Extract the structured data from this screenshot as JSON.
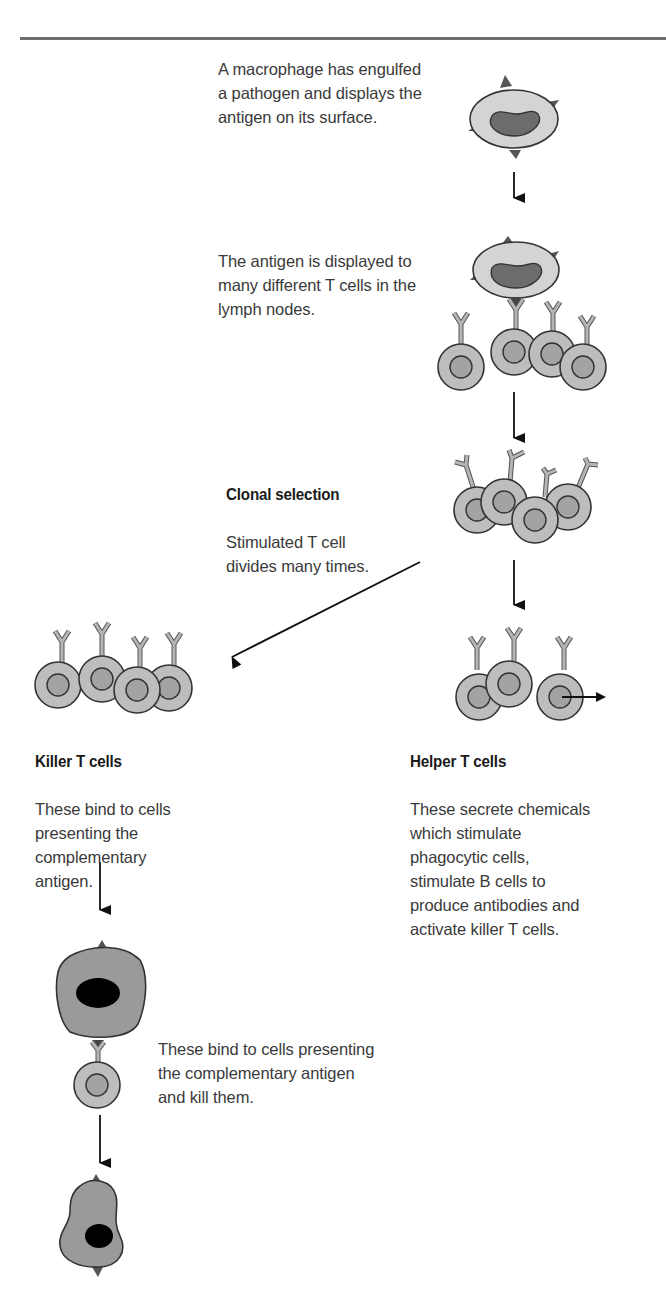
{
  "diagram": {
    "title": "",
    "colors": {
      "cell_fill": "#b9b9b9",
      "cell_nucleus": "#a0a0a0",
      "macrophage_fill": "#d2d2d2",
      "macrophage_nucleus": "#6e6e6e",
      "antigen": "#555555",
      "target_cell_fill": "#9a9a9a",
      "target_nucleus": "#000000",
      "outline": "#333333",
      "arrow": "#111111"
    },
    "steps": [
      {
        "id": "macrophage",
        "text": "A macrophage has engulfed\na pathogen and displays the\nantigen on its surface."
      },
      {
        "id": "presentation",
        "text": "The antigen is displayed to\nmany different T cells in the\nlymph nodes."
      },
      {
        "id": "clonal_selection",
        "title": "Clonal selection",
        "text": "Stimulated T cell\ndivides many times."
      },
      {
        "id": "killer",
        "title": "Killer T cells",
        "text": "These bind to cells\npresenting the\ncomplementary\nantigen."
      },
      {
        "id": "helper",
        "title": "Helper T cells",
        "text": "These secrete chemicals\nwhich stimulate\nphagocytic cells,\nstimulate B cells to\nproduce antibodies and\nactivate killer T cells."
      },
      {
        "id": "kill",
        "text": "These bind to cells presenting\nthe complementary antigen\nand kill them."
      }
    ],
    "arrows": [
      {
        "from": "macrophage",
        "to": "presentation"
      },
      {
        "from": "presentation",
        "to": "clonal_selection"
      },
      {
        "from": "clonal_selection",
        "to": "helper"
      },
      {
        "from": "clonal_selection",
        "to": "killer"
      },
      {
        "from": "killer",
        "to": "kill"
      },
      {
        "from": "kill",
        "to": "dead_cell"
      }
    ]
  }
}
